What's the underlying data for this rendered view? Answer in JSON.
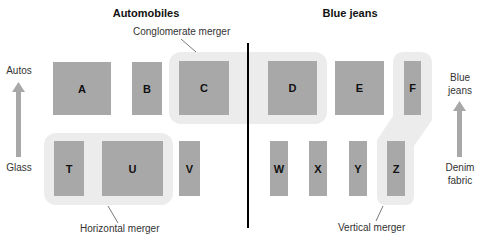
{
  "headers": {
    "left": "Automobiles",
    "right": "Blue jeans"
  },
  "annotations": {
    "conglomerate": "Conglomerate merger",
    "horizontal": "Horizontal merger",
    "vertical": "Vertical merger"
  },
  "axis_left": {
    "top": "Autos",
    "bottom": "Glass"
  },
  "axis_right": {
    "top_line1": "Blue",
    "top_line2": "jeans",
    "bottom_line1": "Denim",
    "bottom_line2": "fabric"
  },
  "firms": {
    "top": [
      "A",
      "B",
      "C",
      "D",
      "E",
      "F"
    ],
    "bottom": [
      "T",
      "U",
      "V",
      "W",
      "X",
      "Y",
      "Z"
    ]
  },
  "colors": {
    "box": "#a8a8a8",
    "highlight": "#ececec",
    "arrow": "#a8a8a8",
    "divider": "#000000"
  }
}
